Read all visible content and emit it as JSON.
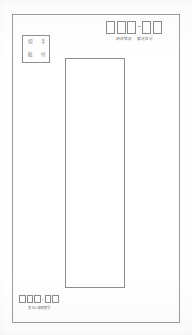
{
  "document": {
    "type": "envelope-form-scan",
    "orientation": "portrait",
    "background_color": "#ffffff",
    "ink_color": "#8d8d8d"
  },
  "envelope": {
    "border_color": "#9b9b9b"
  },
  "stamp_box": {
    "label": "stamp-affix-box",
    "characters": [
      "切",
      "手",
      "貼",
      "付"
    ]
  },
  "recipient_postal_code": {
    "separator": "-",
    "cells_left": [
      "",
      "",
      ""
    ],
    "cells_right": [
      "",
      ""
    ],
    "caption": "請求取扱／郵送区分"
  },
  "address_field": {
    "label": "address-entry-area",
    "value": ""
  },
  "sender_postal_code": {
    "separator": "-",
    "cells_left": [
      "",
      "",
      ""
    ],
    "cells_right": [
      "",
      ""
    ],
    "caption": "差出人郵便番号"
  }
}
